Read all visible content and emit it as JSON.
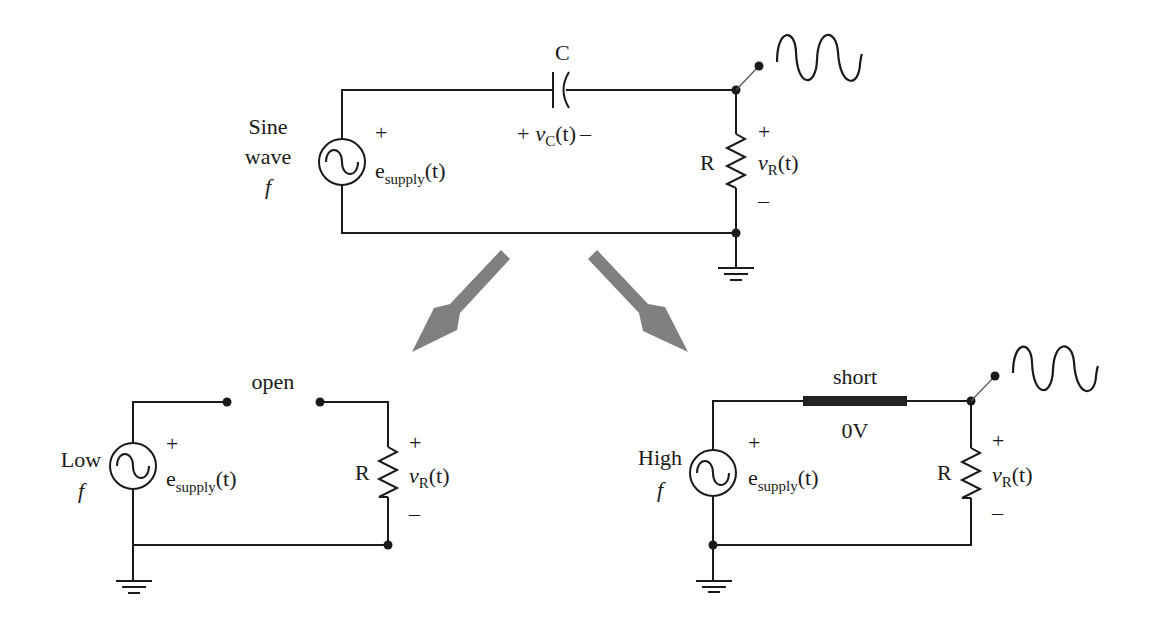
{
  "diagram": {
    "colors": {
      "ink": "#1a1a1a",
      "arrow": "#808080",
      "background": "#ffffff"
    },
    "top_circuit": {
      "source_label": [
        "Sine",
        "wave",
        "f"
      ],
      "source_plus": "+",
      "source_voltage": {
        "main": "e",
        "sub": "supply",
        "arg": "(t)"
      },
      "capacitor_label": "C",
      "capacitor_voltage": {
        "plus": "+",
        "main": "v",
        "sub": "C",
        "arg": "(t)",
        "minus": "–"
      },
      "resistor_label": "R",
      "resistor_voltage": {
        "plus": "+",
        "main": "v",
        "sub": "R",
        "arg": "(t)",
        "minus": "–"
      },
      "output_waveform": "sine-wave-icon"
    },
    "arrows": [
      {
        "name": "to-low-frequency",
        "direction": "down-left"
      },
      {
        "name": "to-high-frequency",
        "direction": "down-right"
      }
    ],
    "low_freq_circuit": {
      "source_label": [
        "Low",
        "f"
      ],
      "source_plus": "+",
      "source_voltage": {
        "main": "e",
        "sub": "supply",
        "arg": "(t)"
      },
      "capacitor_state": "open",
      "resistor_label": "R",
      "resistor_voltage": {
        "plus": "+",
        "main": "v",
        "sub": "R",
        "arg": "(t)",
        "minus": "–"
      }
    },
    "high_freq_circuit": {
      "source_label": [
        "High",
        "f"
      ],
      "source_plus": "+",
      "source_voltage": {
        "main": "e",
        "sub": "supply",
        "arg": "(t)"
      },
      "capacitor_state": "short",
      "capacitor_voltage": "0V",
      "resistor_label": "R",
      "resistor_voltage": {
        "plus": "+",
        "main": "v",
        "sub": "R",
        "arg": "(t)",
        "minus": "–"
      },
      "output_waveform": "sine-wave-icon"
    }
  }
}
